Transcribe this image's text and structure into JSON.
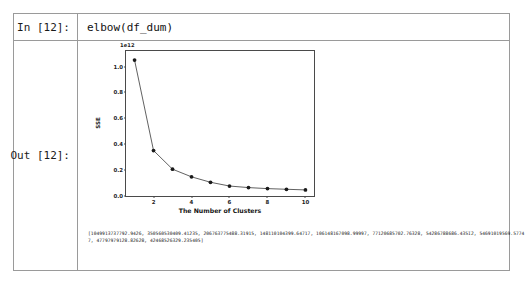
{
  "notebook": {
    "input_cell": {
      "prompt": "In [12]:",
      "code": "elbow(df_dum)"
    },
    "output_cell": {
      "prompt": "Out [12]:",
      "text_repr": "[1049913737792.9426, 350560530409.41235, 206763775488.31915, 148110104399.64717, 106148167098.99997, 77120685702.76328, 54286788686.435I2, 54691019569.57747, 47797979128.82628, 42468526329.235405]"
    }
  },
  "chart_data": {
    "type": "line",
    "title": "",
    "xlabel": "The Number of Clusters",
    "ylabel": "SSE",
    "exponent_label": "1e12",
    "x": [
      1,
      2,
      3,
      4,
      5,
      6,
      7,
      8,
      9,
      10
    ],
    "values": [
      1.05,
      0.351,
      0.207,
      0.148,
      0.106,
      0.077,
      0.065,
      0.057,
      0.052,
      0.047
    ],
    "xlim": [
      0.55,
      10.45
    ],
    "ylim": [
      0.0,
      1.12
    ],
    "xticks": [
      2,
      4,
      6,
      8,
      10
    ],
    "yticks": [
      "0.0",
      "0.2",
      "0.4",
      "0.6",
      "0.8",
      "1.0"
    ],
    "ytick_values": [
      0.0,
      0.2,
      0.4,
      0.6,
      0.8,
      1.0
    ],
    "grid": false,
    "legend": "none",
    "line_color": "#4d4d4d",
    "marker_color": "#1a1a1a",
    "marker": "circle"
  }
}
